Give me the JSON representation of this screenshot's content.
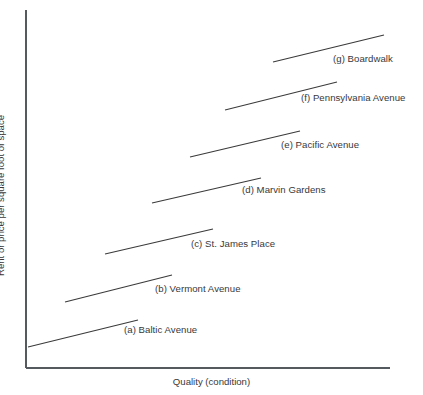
{
  "chart_data": {
    "type": "line",
    "title": "",
    "subtitle": "",
    "xlabel": "Quality (condition)",
    "ylabel": "Rent or price per square foot of space",
    "grid": false,
    "legend_position": "inline-right-of-line",
    "axes": {
      "x_axis_ticks": [],
      "y_axis_ticks": [],
      "x_axis_range_px": [
        26,
        390
      ],
      "y_axis_range_px": [
        10,
        368
      ],
      "note": "Schematic axes with no numeric tick labels; both axes are unlabeled qualitative scales."
    },
    "series": [
      {
        "key": "a",
        "name": "(a) Baltic Avenue",
        "label_text": "(a) Baltic Avenue",
        "x": [
          28,
          138
        ],
        "y": [
          347,
          320
        ],
        "label_x": 124,
        "label_y": 325
      },
      {
        "key": "b",
        "name": "(b) Vermont Avenue",
        "label_text": "(b) Vermont Avenue",
        "x": [
          65,
          172
        ],
        "y": [
          302,
          275
        ],
        "label_x": 155,
        "label_y": 284
      },
      {
        "key": "c",
        "name": "(c) St. James Place",
        "label_text": "(c) St. James Place",
        "x": [
          105,
          213
        ],
        "y": [
          254,
          229
        ],
        "label_x": 191,
        "label_y": 239
      },
      {
        "key": "d",
        "name": "(d) Marvin Gardens",
        "label_text": "(d) Marvin Gardens",
        "x": [
          152,
          261
        ],
        "y": [
          203,
          178
        ],
        "label_x": 242,
        "label_y": 185
      },
      {
        "key": "e",
        "name": "(e) Pacific Avenue",
        "label_text": "(e) Pacific Avenue",
        "x": [
          190,
          300
        ],
        "y": [
          157,
          131
        ],
        "label_x": 281,
        "label_y": 140
      },
      {
        "key": "f",
        "name": "(f) Pennsylvania Avenue",
        "label_text": "(f) Pennsylvania Avenue",
        "x": [
          225,
          337
        ],
        "y": [
          110,
          82
        ],
        "label_x": 301,
        "label_y": 93
      },
      {
        "key": "g",
        "name": "(g) Boardwalk",
        "label_text": "(g) Boardwalk",
        "x": [
          273,
          384
        ],
        "y": [
          62,
          35
        ],
        "label_x": 333,
        "label_y": 54
      }
    ],
    "colors": {
      "background": "#ffffff",
      "axis": "#555a5e",
      "series_line": "#3a3a3a",
      "text": "#38383a"
    }
  }
}
